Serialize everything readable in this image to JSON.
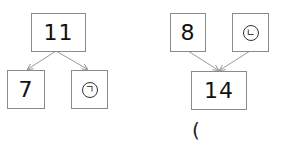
{
  "diagrams": [
    {
      "direction": "split",
      "top": {
        "value": "11"
      },
      "bottom": [
        {
          "value": "7"
        },
        {
          "value": "㉠",
          "label": "ㄱ"
        }
      ]
    },
    {
      "direction": "combine",
      "top": [
        {
          "value": "8"
        },
        {
          "value": "㉡",
          "label": "ㄴ"
        }
      ],
      "bottom": {
        "value": "14"
      },
      "answer_blank": "("
    }
  ],
  "colors": {
    "box_border": "#8a8a8a",
    "arrow": "#9a9a9a",
    "text": "#111111"
  }
}
